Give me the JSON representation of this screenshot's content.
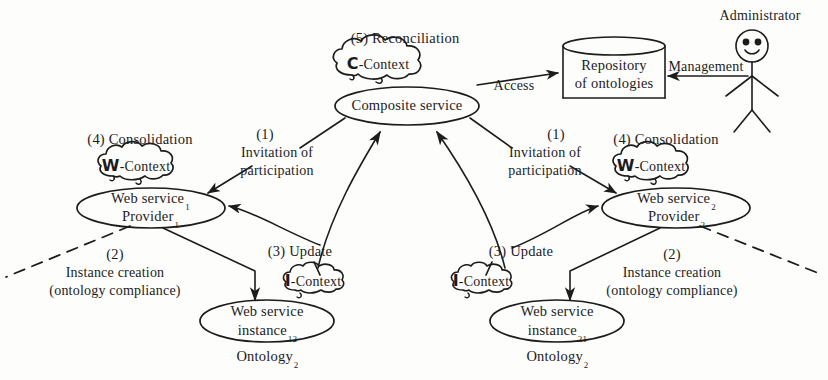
{
  "figure": {
    "background_color": "#fdfdfc",
    "stroke_color": "#1c1c1c"
  },
  "nodes": {
    "composite_service": {
      "label": "Composite service",
      "shape": "ellipse"
    },
    "c_context": {
      "symbol": "C",
      "label": "-Context",
      "shape": "cloud"
    },
    "repository": {
      "line1": "Repository",
      "line2": "of ontologies",
      "shape": "cylinder"
    },
    "administrator": {
      "label": "Administrator",
      "shape": "stick-figure"
    },
    "provider_left": {
      "line1": "Web service",
      "sub1": "1",
      "line2": "Provider",
      "sub2": "1",
      "shape": "ellipse"
    },
    "provider_right": {
      "line1": "Web service",
      "sub1": "2",
      "line2": "Provider",
      "sub2": "2",
      "shape": "ellipse"
    },
    "w_context_left": {
      "symbol": "W",
      "label": "-Context",
      "shape": "cloud"
    },
    "w_context_right": {
      "symbol": "W",
      "label": "-Context",
      "shape": "cloud"
    },
    "i_context_left": {
      "symbol": "I",
      "label": "-Context",
      "shape": "cloud"
    },
    "i_context_right": {
      "symbol": "I",
      "label": "-Context",
      "shape": "cloud"
    },
    "instance_left": {
      "line1": "Web service",
      "line2": "instance",
      "sub": "12",
      "shape": "ellipse"
    },
    "instance_right": {
      "line1": "Web service",
      "line2": "instance",
      "sub": "21",
      "shape": "ellipse"
    },
    "ontology_left": {
      "label": "Ontology",
      "sub": "2"
    },
    "ontology_right": {
      "label": "Ontology",
      "sub": "2"
    }
  },
  "annotations": {
    "step5": "(5) Reconciliation",
    "step4_left": "(4) Consolidation",
    "step4_right": "(4) Consolidation",
    "step1_left_num": "(1)",
    "step1_left_line1": "Invitation of",
    "step1_left_line2": "participation",
    "step1_right_num": "(1)",
    "step1_right_line1": "Invitation of",
    "step1_right_line2": "participation",
    "step2_left_num": "(2)",
    "step2_left_line1": "Instance creation",
    "step2_left_line2": "(ontology compliance)",
    "step2_right_num": "(2)",
    "step2_right_line1": "Instance creation",
    "step2_right_line2": "(ontology compliance)",
    "step3_left": "(3) Update",
    "step3_right": "(3) Update",
    "access": "Access",
    "management": "Management"
  }
}
